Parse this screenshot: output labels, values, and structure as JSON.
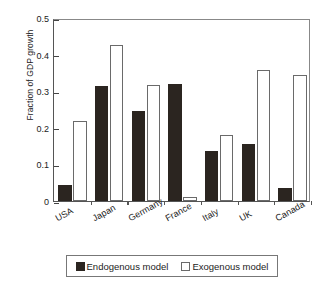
{
  "chart_data": {
    "type": "bar",
    "title": "",
    "xlabel": "",
    "ylabel": "Fraction of GDP growth",
    "categories": [
      "USA",
      "Japan",
      "Germany",
      "France",
      "Italy",
      "UK",
      "Canada"
    ],
    "series": [
      {
        "name": "Endogenous model",
        "style": "filled-black",
        "color": "#2b2520",
        "values": [
          0.045,
          0.315,
          0.246,
          0.32,
          0.138,
          0.155,
          0.036
        ]
      },
      {
        "name": "Exogenous model",
        "style": "open-white",
        "color": "#ffffff",
        "values": [
          0.219,
          0.426,
          0.317,
          0.01,
          0.18,
          0.357,
          0.345
        ]
      }
    ],
    "ylim": [
      0,
      0.5
    ],
    "yticks": [
      0,
      0.1,
      0.2,
      0.3,
      0.4,
      0.5
    ],
    "ytick_labels": [
      "0",
      "0.1",
      "0.2",
      "0.3",
      "0.4",
      "0.5"
    ],
    "grid": false,
    "legend_position": "below-axes",
    "legend_entries": [
      "Endogenous model",
      "Exogenous model"
    ]
  }
}
